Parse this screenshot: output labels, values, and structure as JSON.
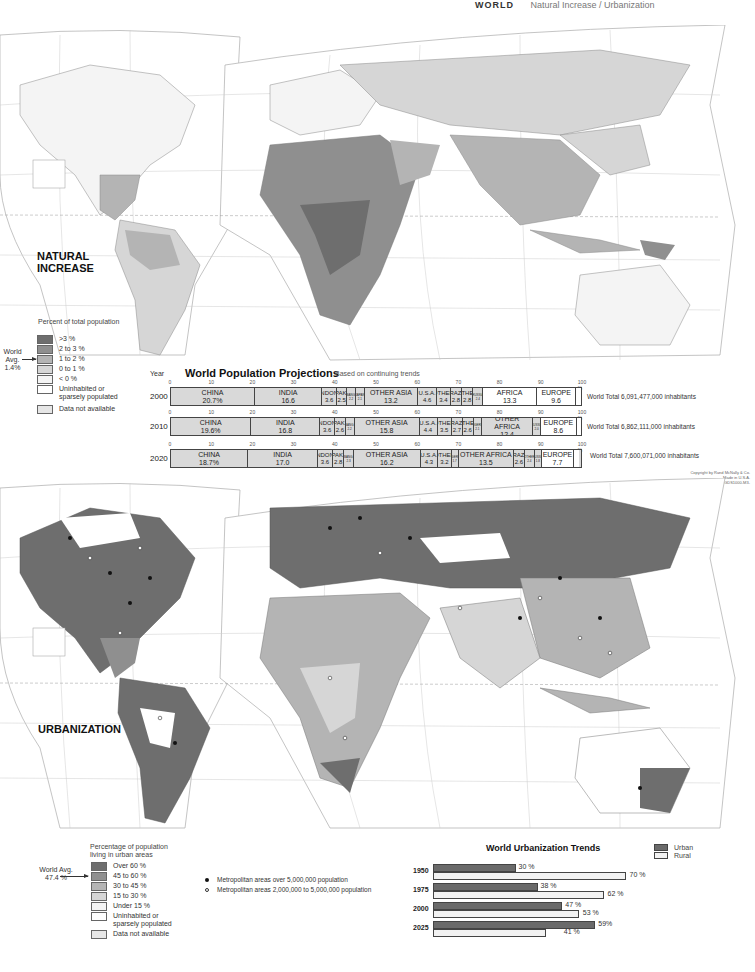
{
  "header": {
    "title": "WORLD",
    "subtitle": "Natural Increase / Urbanization"
  },
  "colors": {
    "level5": "#6e6e6e",
    "level4": "#8f8f8f",
    "level3": "#b4b4b4",
    "level2": "#d6d6d6",
    "level1": "#f4f4f4",
    "uninhabited": "#ffffff",
    "no_data": "#e6e6e6",
    "ocean": "#ffffff",
    "bar_fill": "#d9d9d9",
    "urban": "#6a6a6a",
    "rural": "#f2f2f2"
  },
  "natural_increase": {
    "title_line1": "NATURAL",
    "title_line2": "INCREASE",
    "legend_title": "Percent of total population",
    "world_avg_line1": "World Avg.",
    "world_avg_line2": "1.4%",
    "legend": [
      {
        "label": ">3 %",
        "color": "#6e6e6e"
      },
      {
        "label": "2 to 3 %",
        "color": "#8f8f8f"
      },
      {
        "label": "1 to 2 %",
        "color": "#b4b4b4"
      },
      {
        "label": "0 to 1 %",
        "color": "#d6d6d6"
      },
      {
        "label": "< 0 %",
        "color": "#f4f4f4"
      },
      {
        "label": "Uninhabited or sparsely populated",
        "color": "#ffffff"
      },
      {
        "label": "Data not available",
        "color": "#e6e6e6"
      }
    ],
    "map_labels": {
      "arctic": "Arctic Circle",
      "equator": "Equator",
      "cancer": "Tropic of Cancer",
      "capricorn": "Tropic of Capricorn"
    }
  },
  "projections": {
    "title": "World Population Projections",
    "subtitle": "Based on continuing trends",
    "year_header": "Year",
    "ticks": [
      "0",
      "10",
      "20",
      "30",
      "40",
      "50",
      "60",
      "70",
      "80",
      "90",
      "100 %"
    ],
    "rows": [
      {
        "year": "2000",
        "total": "World Total 6,091,477,000 inhabitants",
        "segments": [
          {
            "name": "CHINA",
            "value": "20.7%",
            "pct": 20.7
          },
          {
            "name": "INDIA",
            "value": "16.6",
            "pct": 16.6
          },
          {
            "name": "INDON.",
            "value": "3.6",
            "pct": 3.6
          },
          {
            "name": "PAK.",
            "value": "2.5",
            "pct": 2.5
          },
          {
            "name": "BANG.",
            "value": "2.2",
            "pct": 2.2
          },
          {
            "name": "JAPAN",
            "value": "2.1",
            "pct": 2.1
          },
          {
            "name": "OTHER ASIA",
            "value": "13.2",
            "pct": 13.2
          },
          {
            "name": "U.S.A.",
            "value": "4.6",
            "pct": 4.6
          },
          {
            "name": "OTHER",
            "value": "3.4",
            "pct": 3.4
          },
          {
            "name": "BRAZIL",
            "value": "2.8",
            "pct": 2.8
          },
          {
            "name": "OTHER",
            "value": "2.8",
            "pct": 2.8
          },
          {
            "name": "RUSSIA",
            "value": "2.4",
            "pct": 2.4
          },
          {
            "name": "AFRICA",
            "value": "13.3",
            "pct": 13.3
          },
          {
            "name": "EUROPE",
            "value": "9.6",
            "pct": 9.6
          },
          {
            "name": "",
            "value": "",
            "pct": 1.2
          }
        ]
      },
      {
        "year": "2010",
        "total": "World Total 6,862,111,000 inhabitants",
        "segments": [
          {
            "name": "CHINA",
            "value": "19.6%",
            "pct": 19.6
          },
          {
            "name": "INDIA",
            "value": "16.8",
            "pct": 16.8
          },
          {
            "name": "INDON.",
            "value": "3.6",
            "pct": 3.6
          },
          {
            "name": "PAK.",
            "value": "2.6",
            "pct": 2.6
          },
          {
            "name": "BANG.",
            "value": "2.2",
            "pct": 2.2
          },
          {
            "name": "OTHER ASIA",
            "value": "15.8",
            "pct": 15.8
          },
          {
            "name": "U.S.A.",
            "value": "4.4",
            "pct": 4.4
          },
          {
            "name": "OTHER",
            "value": "3.5",
            "pct": 3.5
          },
          {
            "name": "BRAZIL",
            "value": "2.7",
            "pct": 2.7
          },
          {
            "name": "OTHER",
            "value": "2.6",
            "pct": 2.6
          },
          {
            "name": "NIGERIA",
            "value": "2.1",
            "pct": 2.1
          },
          {
            "name": "OTHER AFRICA",
            "value": "12.4",
            "pct": 12.4
          },
          {
            "name": "RUSSIA",
            "value": "2.0",
            "pct": 2.0
          },
          {
            "name": "EUROPE",
            "value": "8.6",
            "pct": 8.6
          },
          {
            "name": "",
            "value": "",
            "pct": 1.1
          }
        ]
      },
      {
        "year": "2020",
        "total": "World Total 7,600,071,000 inhabitants",
        "segments": [
          {
            "name": "CHINA",
            "value": "18.7%",
            "pct": 18.7
          },
          {
            "name": "INDIA",
            "value": "17.0",
            "pct": 17.0
          },
          {
            "name": "INDON.",
            "value": "3.6",
            "pct": 3.6
          },
          {
            "name": "PAK.",
            "value": "2.8",
            "pct": 2.8
          },
          {
            "name": "BANG.",
            "value": "2.3",
            "pct": 2.3
          },
          {
            "name": "OTHER ASIA",
            "value": "16.2",
            "pct": 16.2
          },
          {
            "name": "U.S.A.",
            "value": "4.3",
            "pct": 4.3
          },
          {
            "name": "OTHER",
            "value": "3.2",
            "pct": 3.2
          },
          {
            "name": "NIGERIA",
            "value": "1.7",
            "pct": 1.7
          },
          {
            "name": "OTHER AFRICA",
            "value": "13.5",
            "pct": 13.5
          },
          {
            "name": "BRAZIL",
            "value": "2.6",
            "pct": 2.6
          },
          {
            "name": "OTHER",
            "value": "2.4",
            "pct": 2.4
          },
          {
            "name": "RUSSIA",
            "value": "1.8",
            "pct": 1.8
          },
          {
            "name": "EUROPE",
            "value": "7.7",
            "pct": 7.7
          },
          {
            "name": "",
            "value": "",
            "pct": 1.2
          }
        ]
      }
    ]
  },
  "copyright": {
    "line1": "Copyright by Rand McNally & Co.",
    "line2": "Made in U.S.A.",
    "line3": "N-GDS1000-M3-"
  },
  "urbanization": {
    "title": "URBANIZATION",
    "legend_title_line1": "Percentage of population",
    "legend_title_line2": "living in urban areas",
    "world_avg_line1": "World Avg.",
    "world_avg_line2": "47.4 %",
    "legend": [
      {
        "label": "Over 60 %",
        "color": "#6e6e6e"
      },
      {
        "label": "45 to 60 %",
        "color": "#8f8f8f"
      },
      {
        "label": "30 to 45 %",
        "color": "#b4b4b4"
      },
      {
        "label": "15 to 30 %",
        "color": "#d6d6d6"
      },
      {
        "label": "Under 15 %",
        "color": "#f4f4f4"
      },
      {
        "label": "Uninhabited or sparsely populated",
        "color": "#ffffff"
      },
      {
        "label": "Data not available",
        "color": "#e6e6e6"
      }
    ],
    "metro_large": "Metropolitan areas over 5,000,000 population",
    "metro_medium": "Metropolitan areas 2,000,000 to 5,000,000 population"
  },
  "trends": {
    "title": "World Urbanization Trends",
    "legend_urban": "Urban",
    "legend_rural": "Rural"
  },
  "chart_data": [
    {
      "type": "bar",
      "title": "World Population Projections",
      "subtitle": "Based on continuing trends",
      "orientation": "horizontal-stacked",
      "categories": [
        "2000",
        "2010",
        "2020"
      ],
      "xlabel": "Percent of world population",
      "xlim": [
        0,
        100
      ],
      "series_by_year": {
        "2000": {
          "China": 20.7,
          "India": 16.6,
          "Indonesia": 3.6,
          "Pakistan": 2.5,
          "Bangladesh": 2.2,
          "Japan": 2.1,
          "Other Asia": 13.2,
          "U.S.A.": 4.6,
          "Other Americas": 3.4,
          "Brazil": 2.8,
          "Other": 2.8,
          "Russia": 2.4,
          "Africa": 13.3,
          "Europe": 9.6
        },
        "2010": {
          "China": 19.6,
          "India": 16.8,
          "Indonesia": 3.6,
          "Pakistan": 2.6,
          "Bangladesh": 2.2,
          "Other Asia": 15.8,
          "U.S.A.": 4.4,
          "Other Americas": 3.5,
          "Brazil": 2.7,
          "Other": 2.6,
          "Nigeria": 2.1,
          "Other Africa": 12.4,
          "Russia": 2.0,
          "Europe": 8.6
        },
        "2020": {
          "China": 18.7,
          "India": 17.0,
          "Indonesia": 3.6,
          "Pakistan": 2.8,
          "Bangladesh": 2.3,
          "Other Asia": 16.2,
          "U.S.A.": 4.3,
          "Other Americas": 3.2,
          "Nigeria": 1.7,
          "Other Africa": 13.5,
          "Brazil": 2.6,
          "Other": 2.4,
          "Russia": 1.8,
          "Europe": 7.7
        }
      },
      "world_totals": {
        "2000": 6091477000,
        "2010": 6862111000,
        "2020": 7600071000
      }
    },
    {
      "type": "bar",
      "title": "World Urbanization Trends",
      "orientation": "horizontal",
      "categories": [
        "1950",
        "1975",
        "2000",
        "2025"
      ],
      "series": [
        {
          "name": "Urban",
          "values": [
            30,
            38,
            47,
            59
          ]
        },
        {
          "name": "Rural",
          "values": [
            70,
            62,
            53,
            41
          ]
        }
      ],
      "xlim": [
        0,
        100
      ],
      "legend_position": "top-right"
    }
  ],
  "trend_rows": [
    {
      "year": "1950",
      "urban": 30,
      "rural": 70,
      "urban_label": "30 %",
      "rural_label": "70 %"
    },
    {
      "year": "1975",
      "urban": 38,
      "rural": 62,
      "urban_label": "38 %",
      "rural_label": "62 %"
    },
    {
      "year": "2000",
      "urban": 47,
      "rural": 53,
      "urban_label": "47 %",
      "rural_label": "53 %"
    },
    {
      "year": "2025",
      "urban": 59,
      "rural": 41,
      "urban_label": "59%",
      "rural_label": "41 %"
    }
  ]
}
